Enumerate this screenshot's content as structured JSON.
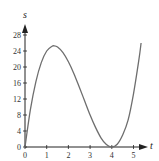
{
  "chart_data": {
    "type": "line",
    "title": "",
    "xlabel": "t",
    "ylabel": "s",
    "xlim": [
      0,
      5.4
    ],
    "ylim": [
      0,
      30
    ],
    "xticks": [
      0,
      1,
      2,
      3,
      4,
      5
    ],
    "yticks": [
      0,
      4,
      8,
      12,
      16,
      20,
      24,
      28
    ],
    "grid": false,
    "legend": null,
    "series": [
      {
        "name": "s(t)",
        "description": "curve rising from 0 to a max of about 25 near t≈1.33, falling to 0 at t=4, then rising again to about 26 at t≈5.35",
        "x": [
          0,
          0.25,
          0.5,
          0.75,
          1.0,
          1.25,
          1.33,
          1.5,
          1.75,
          2.0,
          2.25,
          2.5,
          2.75,
          3.0,
          3.25,
          3.5,
          3.75,
          4.0,
          4.25,
          4.5,
          4.75,
          5.0,
          5.25,
          5.35
        ],
        "y": [
          0,
          9.4,
          16.3,
          21.1,
          24.0,
          25.2,
          25.3,
          25.0,
          23.6,
          21.3,
          18.4,
          15.0,
          11.5,
          8.0,
          4.9,
          2.3,
          0.6,
          0,
          0.7,
          3.0,
          6.7,
          13.3,
          21.9,
          26.0
        ]
      }
    ],
    "colors": {
      "curve": "#6e6e6e",
      "axis": "#222222"
    }
  }
}
